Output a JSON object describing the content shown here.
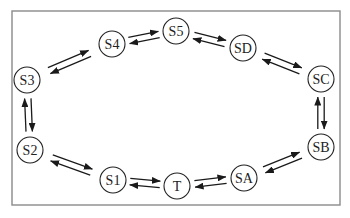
{
  "diagram": {
    "type": "state-cycle",
    "colors": {
      "frame": "#8a8a8a",
      "stroke": "#222222",
      "background": "#ffffff"
    },
    "nodes": [
      {
        "id": "S5",
        "label": "S5",
        "x": 176,
        "y": 31
      },
      {
        "id": "SD",
        "label": "SD",
        "x": 243,
        "y": 48
      },
      {
        "id": "SC",
        "label": "SC",
        "x": 321,
        "y": 79
      },
      {
        "id": "SB",
        "label": "SB",
        "x": 321,
        "y": 147
      },
      {
        "id": "SA",
        "label": "SA",
        "x": 244,
        "y": 178
      },
      {
        "id": "T",
        "label": "T",
        "x": 177,
        "y": 186
      },
      {
        "id": "S1",
        "label": "S1",
        "x": 113,
        "y": 180
      },
      {
        "id": "S2",
        "label": "S2",
        "x": 30,
        "y": 150
      },
      {
        "id": "S3",
        "label": "S3",
        "x": 27,
        "y": 80
      },
      {
        "id": "S4",
        "label": "S4",
        "x": 112,
        "y": 44
      }
    ],
    "edges": [
      {
        "from": "S5",
        "to": "SD",
        "bidirectional": true
      },
      {
        "from": "SD",
        "to": "SC",
        "bidirectional": true
      },
      {
        "from": "SC",
        "to": "SB",
        "bidirectional": true
      },
      {
        "from": "SB",
        "to": "SA",
        "bidirectional": true
      },
      {
        "from": "SA",
        "to": "T",
        "bidirectional": true
      },
      {
        "from": "T",
        "to": "S1",
        "bidirectional": true
      },
      {
        "from": "S1",
        "to": "S2",
        "bidirectional": true
      },
      {
        "from": "S2",
        "to": "S3",
        "bidirectional": true
      },
      {
        "from": "S3",
        "to": "S4",
        "bidirectional": true
      },
      {
        "from": "S4",
        "to": "S5",
        "bidirectional": true
      }
    ]
  }
}
